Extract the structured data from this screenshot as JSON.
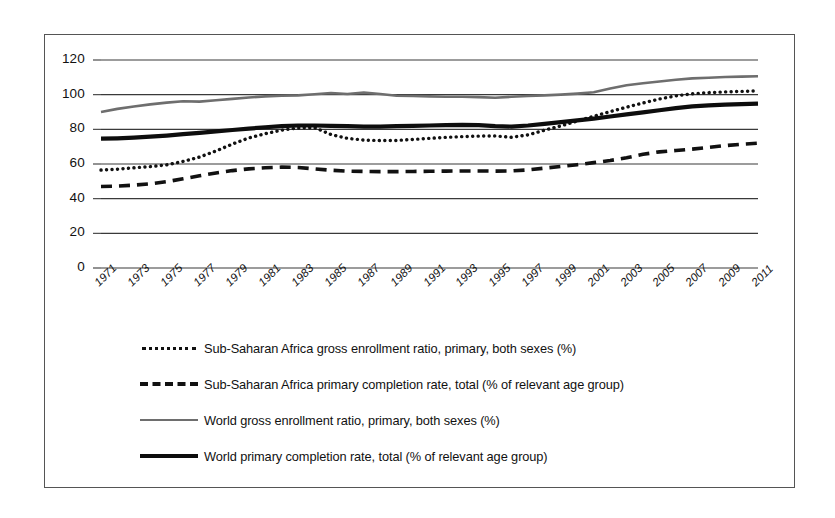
{
  "chart_data": {
    "type": "line",
    "title": "",
    "xlabel": "",
    "ylabel": "",
    "ylim": [
      0,
      120
    ],
    "ytick_values": [
      0,
      20,
      40,
      60,
      80,
      100,
      120
    ],
    "ytick_labels": [
      "0",
      "20",
      "40",
      "60",
      "80",
      "100",
      "120"
    ],
    "grid": true,
    "legend_position": "below",
    "x": [
      1971,
      1972,
      1973,
      1974,
      1975,
      1976,
      1977,
      1978,
      1979,
      1980,
      1981,
      1982,
      1983,
      1984,
      1985,
      1986,
      1987,
      1988,
      1989,
      1990,
      1991,
      1992,
      1993,
      1994,
      1995,
      1996,
      1997,
      1998,
      1999,
      2000,
      2001,
      2002,
      2003,
      2004,
      2005,
      2006,
      2007,
      2008,
      2009,
      2010,
      2011
    ],
    "xtick_labels": [
      "1971",
      "1973",
      "1975",
      "1977",
      "1979",
      "1981",
      "1983",
      "1985",
      "1987",
      "1989",
      "1991",
      "1993",
      "1995",
      "1997",
      "1999",
      "2001",
      "2003",
      "2005",
      "2007",
      "2009",
      "2011"
    ],
    "series": [
      {
        "name": "Sub-Saharan Africa gross enrollment ratio, primary, both sexes (%)",
        "style": "dotted",
        "color": "#111111",
        "values": [
          56.5,
          57.0,
          57.8,
          58.5,
          59.5,
          61.5,
          64.0,
          67.5,
          71.5,
          75.0,
          77.5,
          79.5,
          80.8,
          81.0,
          77.0,
          74.8,
          73.8,
          73.5,
          73.6,
          74.2,
          74.8,
          75.4,
          75.8,
          76.1,
          76.2,
          75.4,
          76.8,
          79.5,
          82.0,
          84.8,
          87.5,
          90.2,
          92.8,
          95.2,
          97.5,
          99.3,
          100.5,
          101.2,
          101.6,
          101.9,
          102.2
        ]
      },
      {
        "name": "Sub-Saharan Africa primary completion rate, total (% of relevant age group)",
        "style": "dashed",
        "color": "#111111",
        "values": [
          47.0,
          47.3,
          47.8,
          48.6,
          49.8,
          51.5,
          53.2,
          54.8,
          56.2,
          57.2,
          57.8,
          58.2,
          58.0,
          57.2,
          56.4,
          55.9,
          55.7,
          55.6,
          55.6,
          55.7,
          55.8,
          55.9,
          56.0,
          56.0,
          55.9,
          56.0,
          56.6,
          57.6,
          58.6,
          59.6,
          60.8,
          62.0,
          63.6,
          65.6,
          67.0,
          67.8,
          68.6,
          69.6,
          70.6,
          71.4,
          72.0
        ]
      },
      {
        "name": "World gross enrollment ratio, primary, both sexes (%)",
        "style": "solid-thin",
        "color": "#6e6e6e",
        "values": [
          90.0,
          91.8,
          93.2,
          94.4,
          95.4,
          96.2,
          96.0,
          96.8,
          97.6,
          98.4,
          99.0,
          99.4,
          99.6,
          100.2,
          101.0,
          100.4,
          101.2,
          100.4,
          99.4,
          99.2,
          99.0,
          98.8,
          98.8,
          98.6,
          98.2,
          98.8,
          99.2,
          99.6,
          100.0,
          100.6,
          101.4,
          103.6,
          105.4,
          106.6,
          107.6,
          108.6,
          109.4,
          109.8,
          110.2,
          110.4,
          110.6
        ]
      },
      {
        "name": "World primary completion rate, total (% of relevant age group)",
        "style": "solid-thick",
        "color": "#0d0d0d",
        "values": [
          74.6,
          74.8,
          75.2,
          75.8,
          76.4,
          77.2,
          78.0,
          78.8,
          79.6,
          80.4,
          81.2,
          81.8,
          82.2,
          82.2,
          82.0,
          81.8,
          81.6,
          81.6,
          81.8,
          82.0,
          82.2,
          82.4,
          82.6,
          82.4,
          81.8,
          81.6,
          82.2,
          83.2,
          84.2,
          85.2,
          86.2,
          87.4,
          88.6,
          89.8,
          91.0,
          92.2,
          93.2,
          93.8,
          94.2,
          94.5,
          94.8
        ]
      }
    ]
  }
}
